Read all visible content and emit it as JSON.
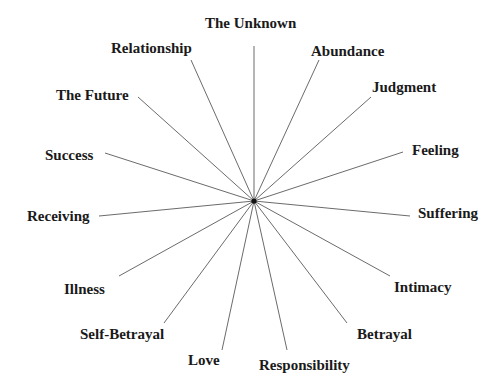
{
  "diagram": {
    "type": "radial-spoke",
    "center": {
      "x": 254,
      "y": 201
    },
    "line_color": "#6b6b6b",
    "hub_color": "#111111",
    "label_color": "#1a1a1a",
    "spokes": [
      {
        "label": "The Unknown",
        "end": [
          254,
          46
        ],
        "label_pos": [
          205,
          16
        ]
      },
      {
        "label": "Abundance",
        "end": [
          319,
          60
        ],
        "label_pos": [
          311,
          44
        ]
      },
      {
        "label": "Judgment",
        "end": [
          371,
          97
        ],
        "label_pos": [
          372,
          80
        ]
      },
      {
        "label": "Feeling",
        "end": [
          403,
          152
        ],
        "label_pos": [
          412,
          143
        ]
      },
      {
        "label": "Suffering",
        "end": [
          410,
          216
        ],
        "label_pos": [
          418,
          206
        ]
      },
      {
        "label": "Intimacy",
        "end": [
          390,
          276
        ],
        "label_pos": [
          394,
          280
        ]
      },
      {
        "label": "Betrayal",
        "end": [
          347,
          323
        ],
        "label_pos": [
          357,
          327
        ]
      },
      {
        "label": "Responsibility",
        "end": [
          287,
          350
        ],
        "label_pos": [
          259,
          358
        ]
      },
      {
        "label": "Love",
        "end": [
          222,
          350
        ],
        "label_pos": [
          188,
          353
        ]
      },
      {
        "label": "Self-Betrayal",
        "end": [
          164,
          323
        ],
        "label_pos": [
          80,
          327
        ]
      },
      {
        "label": "Illness",
        "end": [
          119,
          276
        ],
        "label_pos": [
          64,
          282
        ]
      },
      {
        "label": "Receiving",
        "end": [
          99,
          216
        ],
        "label_pos": [
          27,
          209
        ]
      },
      {
        "label": "Success",
        "end": [
          105,
          153
        ],
        "label_pos": [
          45,
          148
        ]
      },
      {
        "label": "The Future",
        "end": [
          138,
          97
        ],
        "label_pos": [
          56,
          88
        ]
      },
      {
        "label": "Relationship",
        "end": [
          191,
          60
        ],
        "label_pos": [
          111,
          41
        ]
      }
    ]
  }
}
